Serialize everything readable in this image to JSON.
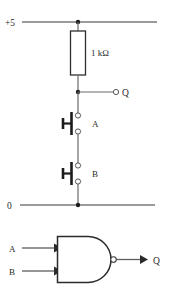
{
  "figure": {
    "background_color": "#ffffff",
    "wire_color": "#6b6b6b",
    "ink_color": "#1c1c1c"
  },
  "circuit": {
    "supply_rail": {
      "label": "+5",
      "name": "positive-supply-rail"
    },
    "ground_rail": {
      "label": "0",
      "name": "zero-volt-rail"
    },
    "resistor": {
      "label": "1 kΩ",
      "value": "1 k",
      "unit": "Ω",
      "name": "pull-up-resistor"
    },
    "output": {
      "label": "Q",
      "name": "output-terminal-q"
    },
    "switches": [
      {
        "label": "A",
        "name": "push-button-switch-a",
        "type": "normally-open-push-button"
      },
      {
        "label": "B",
        "name": "push-button-switch-b",
        "type": "normally-open-push-button"
      }
    ]
  },
  "logic_symbol": {
    "gate_type": "NAND",
    "inputs": [
      {
        "label": "A",
        "name": "gate-input-a"
      },
      {
        "label": "B",
        "name": "gate-input-b"
      }
    ],
    "output": {
      "label": "Q",
      "name": "gate-output-q"
    },
    "has_inversion_bubble": true
  }
}
